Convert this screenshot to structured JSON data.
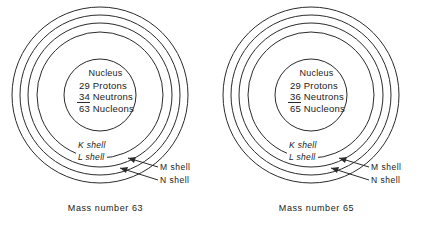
{
  "figure": {
    "type": "atomic-shell-diagram",
    "shell_label_inner_k": "K shell",
    "shell_label_inner_l": "L shell",
    "shell_label_outer_m": "M shell",
    "shell_label_outer_n": "N shell",
    "nucleus_title": "Nucleus",
    "label_protons": "Protons",
    "label_neutrons": "Neutrons",
    "label_nucleons": "Nucleons"
  },
  "atoms": [
    {
      "id": "atom-mass-63",
      "caption": "Mass number 63",
      "nucleus": {
        "title": "Nucleus",
        "protons": "29",
        "protons_label": "Protons",
        "neutrons": "34",
        "neutrons_label": "Neutrons",
        "nucleons": "63",
        "nucleons_label": "Nucleons"
      },
      "shells": {
        "k": "K shell",
        "l": "L shell",
        "m": "M shell",
        "n": "N shell"
      }
    },
    {
      "id": "atom-mass-65",
      "caption": "Mass number 65",
      "nucleus": {
        "title": "Nucleus",
        "protons": "29",
        "protons_label": "Protons",
        "neutrons": "36",
        "neutrons_label": "Neutrons",
        "nucleons": "65",
        "nucleons_label": "Nucleons"
      },
      "shells": {
        "k": "K shell",
        "l": "L shell",
        "m": "M shell",
        "n": "N shell"
      }
    }
  ],
  "geometry": {
    "center_x": 100,
    "center_y": 95,
    "shell_radii": [
      88,
      80,
      72,
      63
    ],
    "nucleus_radius": 36
  },
  "colors": {
    "stroke": "#2b2b2b",
    "background": "#ffffff",
    "text": "#1a1a1a"
  }
}
